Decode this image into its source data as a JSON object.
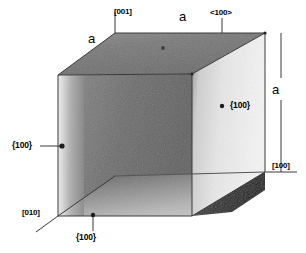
{
  "figure": {
    "type": "crystal-unit-cell-diagram",
    "background_color": "#ffffff",
    "line_color": "#3a3a3a",
    "text_color": "#000000",
    "edge_length_symbol": "a"
  },
  "labels": {
    "axis_001": "[001]",
    "axis_010": "[010]",
    "axis_100": "[100]",
    "direction_family": "<100>",
    "edge_a_top_left": "a",
    "edge_a_top_right": "a",
    "edge_a_right": "a",
    "plane_left": "{100}",
    "plane_right": "{100}",
    "plane_bottom": "{100}"
  },
  "markers": [
    {
      "name": "plane-marker-left",
      "x": 62,
      "y": 146,
      "label": "{100}"
    },
    {
      "name": "plane-marker-right",
      "x": 222,
      "y": 106,
      "label": "{100}"
    },
    {
      "name": "plane-marker-bottom",
      "x": 93,
      "y": 215,
      "label": "{100}"
    },
    {
      "name": "plane-marker-top",
      "x": 163,
      "y": 48,
      "label": ""
    }
  ],
  "geometry": {
    "vertices": {
      "top_front_left": [
        58,
        75
      ],
      "top_back_left": [
        115,
        33
      ],
      "top_back_right": [
        265,
        33
      ],
      "top_front_right": [
        192,
        74
      ],
      "bottom_front_left": [
        58,
        216
      ],
      "bottom_front_right": [
        192,
        216
      ],
      "bottom_back_right": [
        265,
        172
      ],
      "bottom_back_left": [
        115,
        176
      ]
    }
  }
}
